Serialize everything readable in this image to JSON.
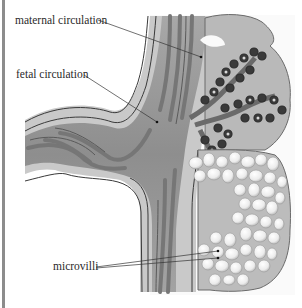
{
  "figure": {
    "labels": {
      "maternal": "maternal circulation",
      "fetal": "fetal circulation",
      "microvilli": "microvilli"
    }
  },
  "colors": {
    "background": "#ffffff",
    "outer_tissue": "#c8c8c8",
    "stalk_mid": "#9a9a9a",
    "vessel_dark": "#7a7a7a",
    "outline": "#3a3a3a",
    "villus_dark": "#2e2e2e",
    "bubble": "#f2f2f2",
    "label_text": "#2a2a2a"
  }
}
